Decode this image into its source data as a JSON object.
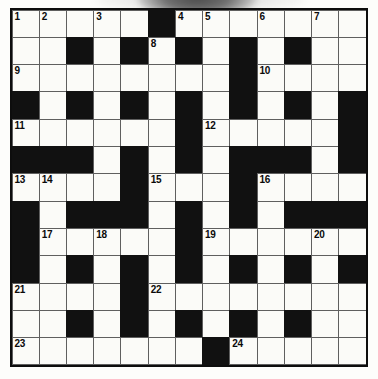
{
  "puzzle": {
    "title": "Crossword Grid",
    "type": "crossword",
    "rows": 13,
    "cols": 13,
    "colors": {
      "block": "#111111",
      "cell": "#fbfbf8",
      "grid_line": "#5f5f5f",
      "frame": "#0d0d0d",
      "number_text": "#0a0a0a"
    },
    "clue_numbers_visible": [
      1,
      2,
      3,
      4,
      5,
      6,
      7,
      8,
      9,
      10,
      11,
      12,
      13,
      14,
      15,
      16,
      17,
      18,
      19,
      20,
      21,
      22,
      23,
      24
    ],
    "legend": {
      "0": "white cell",
      "1": "black cell (blocked)"
    },
    "grid": [
      [
        0,
        0,
        0,
        0,
        0,
        1,
        0,
        0,
        0,
        0,
        0,
        0,
        0
      ],
      [
        0,
        0,
        1,
        0,
        1,
        0,
        1,
        0,
        1,
        0,
        1,
        0,
        0
      ],
      [
        0,
        0,
        0,
        0,
        0,
        0,
        0,
        0,
        1,
        0,
        0,
        0,
        0
      ],
      [
        1,
        0,
        1,
        0,
        1,
        0,
        1,
        0,
        1,
        0,
        1,
        0,
        1
      ],
      [
        0,
        0,
        0,
        0,
        0,
        0,
        1,
        0,
        0,
        0,
        0,
        0,
        1
      ],
      [
        1,
        1,
        1,
        0,
        1,
        0,
        1,
        0,
        1,
        1,
        1,
        0,
        1
      ],
      [
        0,
        0,
        0,
        0,
        1,
        0,
        0,
        0,
        1,
        0,
        0,
        0,
        0
      ],
      [
        1,
        0,
        1,
        1,
        1,
        0,
        1,
        0,
        1,
        0,
        1,
        1,
        1
      ],
      [
        1,
        0,
        0,
        0,
        0,
        0,
        1,
        0,
        0,
        0,
        0,
        0,
        0
      ],
      [
        1,
        0,
        1,
        0,
        1,
        0,
        1,
        0,
        1,
        0,
        1,
        0,
        1
      ],
      [
        0,
        0,
        0,
        0,
        1,
        0,
        0,
        0,
        0,
        0,
        0,
        0,
        0
      ],
      [
        0,
        0,
        1,
        0,
        1,
        0,
        1,
        0,
        1,
        0,
        1,
        0,
        0
      ],
      [
        0,
        0,
        0,
        0,
        0,
        0,
        0,
        1,
        0,
        0,
        0,
        0,
        0
      ]
    ],
    "numbers": [
      {
        "n": 1,
        "row": 0,
        "col": 0
      },
      {
        "n": 2,
        "row": 0,
        "col": 1
      },
      {
        "n": 3,
        "row": 0,
        "col": 3
      },
      {
        "n": 4,
        "row": 0,
        "col": 6
      },
      {
        "n": 5,
        "row": 0,
        "col": 7
      },
      {
        "n": 6,
        "row": 0,
        "col": 9
      },
      {
        "n": 7,
        "row": 0,
        "col": 11
      },
      {
        "n": 8,
        "row": 1,
        "col": 5
      },
      {
        "n": 9,
        "row": 2,
        "col": 0
      },
      {
        "n": 10,
        "row": 2,
        "col": 9
      },
      {
        "n": 11,
        "row": 4,
        "col": 0
      },
      {
        "n": 12,
        "row": 4,
        "col": 7
      },
      {
        "n": 13,
        "row": 6,
        "col": 0
      },
      {
        "n": 14,
        "row": 6,
        "col": 1
      },
      {
        "n": 15,
        "row": 6,
        "col": 5
      },
      {
        "n": 16,
        "row": 6,
        "col": 9
      },
      {
        "n": 17,
        "row": 8,
        "col": 1
      },
      {
        "n": 18,
        "row": 8,
        "col": 3
      },
      {
        "n": 19,
        "row": 8,
        "col": 7
      },
      {
        "n": 20,
        "row": 8,
        "col": 11
      },
      {
        "n": 21,
        "row": 10,
        "col": 0
      },
      {
        "n": 22,
        "row": 10,
        "col": 5
      },
      {
        "n": 23,
        "row": 12,
        "col": 0
      },
      {
        "n": 24,
        "row": 12,
        "col": 8
      }
    ],
    "letters": []
  }
}
